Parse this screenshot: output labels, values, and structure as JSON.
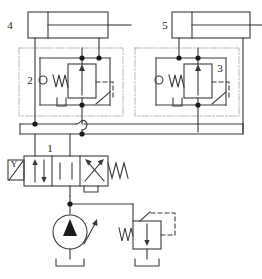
{
  "diagram": {
    "type": "hydraulic-schematic",
    "line_color": "#3a3a3a",
    "enclosure_color": "#b9b9b9",
    "background": "#ffffff"
  },
  "labels": {
    "cylinder_left": "4",
    "cylinder_right": "5",
    "valve_left": "2",
    "valve_right": "3",
    "directional_valve": "1",
    "solenoid": "Y"
  },
  "components": [
    {
      "id": "cyl-4",
      "tag": "4",
      "name": "double-acting-cylinder-left",
      "kind": "cylinder",
      "ports": 2
    },
    {
      "id": "cyl-5",
      "tag": "5",
      "name": "double-acting-cylinder-right",
      "kind": "cylinder",
      "ports": 2
    },
    {
      "id": "valve-2",
      "tag": "2",
      "name": "pilot-operated-check-valve-left",
      "kind": "pressure-control-valve",
      "features": [
        "spring",
        "pilot-line",
        "drain"
      ]
    },
    {
      "id": "valve-3",
      "tag": "3",
      "name": "pilot-operated-check-valve-right",
      "kind": "pressure-control-valve",
      "features": [
        "spring",
        "pilot-line",
        "drain"
      ]
    },
    {
      "id": "dcv-1",
      "tag": "1",
      "name": "directional-control-valve",
      "kind": "4-3-way-valve",
      "actuator_left": "Y",
      "actuator_right": "spring",
      "positions": 3
    },
    {
      "id": "pump",
      "tag": "",
      "name": "variable-displacement-pump",
      "kind": "pump"
    },
    {
      "id": "relief",
      "tag": "",
      "name": "pressure-relief-valve",
      "kind": "relief-valve",
      "features": [
        "spring",
        "pilot-line"
      ]
    },
    {
      "id": "reservoir",
      "tag": "",
      "name": "reservoir",
      "kind": "tank"
    }
  ]
}
